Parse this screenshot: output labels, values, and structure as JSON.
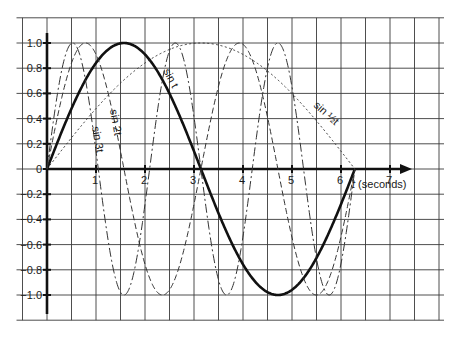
{
  "chart_data": {
    "type": "line",
    "title": "",
    "xlabel": "t (seconds)",
    "ylabel": "",
    "xlim": [
      0,
      8
    ],
    "ylim": [
      -1.2,
      1.2
    ],
    "grid": true,
    "grid_step_x": 0.5,
    "grid_step_y": 0.2,
    "legend": "inline labels on curves",
    "x_ticks": [
      "1",
      "2",
      "3",
      "4",
      "5",
      "6",
      "7"
    ],
    "y_ticks": [
      "1.0",
      "0.8",
      "0.6",
      "0.4",
      "0.2",
      "0",
      "−0.2",
      "−0.4",
      "−0.6",
      "−0.8",
      "−1.0"
    ],
    "domain": [
      0,
      6.2832
    ],
    "series": [
      {
        "name": "sin t",
        "label": "sin t",
        "frequency": 1,
        "style": "solid-bold",
        "color": "#111111",
        "key_points": {
          "t": [
            0,
            1.571,
            3.142,
            4.712,
            6.283
          ],
          "y": [
            0,
            1,
            0,
            -1,
            0
          ]
        }
      },
      {
        "name": "sin 2t",
        "label": "sin 2t",
        "frequency": 2,
        "style": "dashed",
        "color": "#333333",
        "key_points": {
          "t": [
            0,
            0.785,
            1.571,
            2.356,
            3.142,
            3.927,
            4.712,
            5.498,
            6.283
          ],
          "y": [
            0,
            1,
            0,
            -1,
            0,
            1,
            0,
            -1,
            0
          ]
        }
      },
      {
        "name": "sin 3t",
        "label": "sin 3t",
        "frequency": 3,
        "style": "dash-dot",
        "color": "#333333",
        "key_points": {
          "t": [
            0,
            0.524,
            1.047,
            1.571,
            2.094,
            2.618,
            3.142,
            3.665,
            4.189,
            4.712,
            5.236,
            5.76,
            6.283
          ],
          "y": [
            0,
            1,
            0,
            -1,
            0,
            1,
            0,
            -1,
            0,
            1,
            0,
            -1,
            0
          ]
        }
      },
      {
        "name": "sin ½t",
        "label": "sin ½t",
        "frequency": 0.5,
        "style": "dotted",
        "color": "#333333",
        "key_points": {
          "t": [
            0,
            3.142,
            6.283
          ],
          "y": [
            0,
            1,
            0
          ]
        }
      }
    ]
  },
  "axis": {
    "x_label_italic": "t",
    "x_label_rest": " (seconds)"
  }
}
